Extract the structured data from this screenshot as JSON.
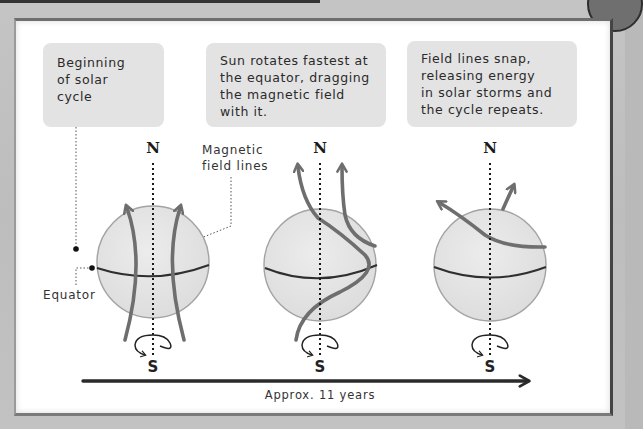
{
  "callouts": [
    {
      "lines": [
        "Beginning",
        "of solar",
        "cycle"
      ]
    },
    {
      "lines": [
        "Sun rotates fastest at",
        "the equator, dragging",
        "the magnetic field",
        "with it."
      ]
    },
    {
      "lines": [
        "Field lines snap,",
        "releasing energy",
        "in solar storms and",
        "the cycle repeats."
      ]
    }
  ],
  "stages": [
    {
      "north": "N",
      "south": "S"
    },
    {
      "north": "N",
      "south": "S"
    },
    {
      "north": "N",
      "south": "S"
    }
  ],
  "labels": {
    "equator": "Equator",
    "magnetic_field_lines": [
      "Magnetic",
      "field lines"
    ]
  },
  "timeline": {
    "label": "Approx. 11 years"
  },
  "colors": {
    "sphere_fill": "#e4e4e4",
    "sphere_stroke": "#9c9c9c",
    "field_line": "#6e6e6e",
    "equator_line": "#2f2f2f",
    "callout_bg": "#e3e3e3",
    "timeline": "#2a2a2a"
  }
}
